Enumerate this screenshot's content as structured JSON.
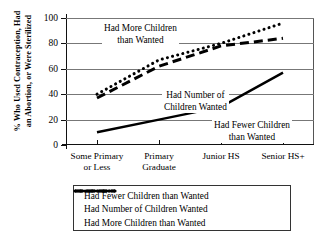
{
  "chart_data": {
    "type": "line",
    "title": "",
    "xlabel": "",
    "ylabel": "% Who Used Contraception, Had an Abortion, or Were Sterilized",
    "ylabel_line1": "% Who Used Contraception, Had",
    "ylabel_line2": "an Abortion, or Were Sterilized",
    "categories": [
      "Some Primary or Less",
      "Primary Graduate",
      "Junior HS",
      "Senior HS+"
    ],
    "category_lines": [
      [
        "Some Primary",
        "or Less"
      ],
      [
        "Primary",
        "Graduate"
      ],
      [
        "Junior HS"
      ],
      [
        "Senior HS+"
      ]
    ],
    "ylim": [
      0,
      100
    ],
    "yticks": [
      0,
      20,
      40,
      60,
      80,
      100
    ],
    "ytick_labels": [
      "0",
      "20",
      "40",
      "60",
      "80",
      "100"
    ],
    "grid": true,
    "legend_position": "below",
    "series": [
      {
        "name": "Had Fewer Children than Wanted",
        "style": "solid",
        "color": "#000000",
        "values": [
          10,
          20,
          30,
          57
        ]
      },
      {
        "name": "Had Number of Children Wanted",
        "style": "dashed",
        "color": "#000000",
        "values": [
          37,
          62,
          78,
          84
        ]
      },
      {
        "name": "Had More Children than Wanted",
        "style": "dotted",
        "color": "#000000",
        "values": [
          40,
          67,
          80,
          96
        ]
      }
    ],
    "annotations": [
      {
        "id": "more",
        "line1": "Had More Children",
        "line2": "than Wanted"
      },
      {
        "id": "number",
        "line1": "Had Number of",
        "line2": "Children Wanted"
      },
      {
        "id": "fewer",
        "line1": "Had Fewer Children",
        "line2": "than Wanted"
      }
    ]
  },
  "legend": {
    "entries": [
      {
        "label": "Had Fewer Children than Wanted",
        "style": "solid"
      },
      {
        "label": "Had Number of Children Wanted",
        "style": "dashed"
      },
      {
        "label": "Had More Children than Wanted",
        "style": "dotted"
      }
    ]
  }
}
